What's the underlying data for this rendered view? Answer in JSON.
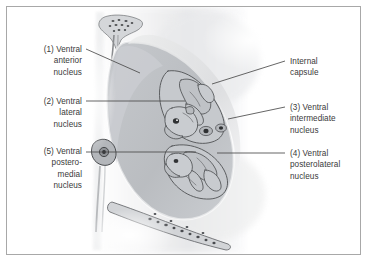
{
  "figure": {
    "border_color": "#a8a8a8",
    "background_color": "#ffffff",
    "text_color": "#3a3a3a",
    "leader_color": "#4a4a4a",
    "mass_color": "#b9bcc0",
    "mass_color_light": "#d3d5d8",
    "outline_color": "#555558"
  },
  "labels": {
    "left": [
      {
        "id": "ventral-anterior-nucleus",
        "number": "(1)",
        "text": "(1) Ventral\nanterior\nnucleus",
        "x": 14,
        "y": 44,
        "width": 68
      },
      {
        "id": "ventral-lateral-nucleus",
        "number": "(2)",
        "text": "(2) Ventral\nlateral\nnucleus",
        "x": 14,
        "y": 96,
        "width": 68
      },
      {
        "id": "ventral-posteromedial-nucleus",
        "number": "(5)",
        "text": "(5) Ventral\npostero-\nmedial\nnucleus",
        "x": 14,
        "y": 146,
        "width": 68
      }
    ],
    "right": [
      {
        "id": "internal-capsule",
        "number": "",
        "text": "Internal\ncapsule",
        "x": 290,
        "y": 56,
        "width": 70
      },
      {
        "id": "ventral-intermediate-nucleus",
        "number": "(3)",
        "text": "(3) Ventral\nintermediate\nnucleus",
        "x": 290,
        "y": 102,
        "width": 72
      },
      {
        "id": "ventral-posterolateral-nucleus",
        "number": "(4)",
        "text": "(4) Ventral\nposterolateral\nnucleus",
        "x": 290,
        "y": 148,
        "width": 72
      }
    ]
  },
  "leaders": [
    {
      "id": "leader-ventral-anterior",
      "x1": 86,
      "y1": 49,
      "x2": 140,
      "y2": 73
    },
    {
      "id": "leader-ventral-lateral",
      "x1": 86,
      "y1": 101,
      "x2": 185,
      "y2": 101
    },
    {
      "id": "leader-ventral-posteromedial",
      "x1": 86,
      "y1": 152,
      "x2": 196,
      "y2": 152
    },
    {
      "id": "leader-internal-capsule",
      "x1": 285,
      "y1": 61,
      "x2": 212,
      "y2": 84
    },
    {
      "id": "leader-ventral-intermediate",
      "x1": 285,
      "y1": 107,
      "x2": 228,
      "y2": 119
    },
    {
      "id": "leader-ventral-posterolateral",
      "x1": 285,
      "y1": 153,
      "x2": 217,
      "y2": 153
    }
  ]
}
